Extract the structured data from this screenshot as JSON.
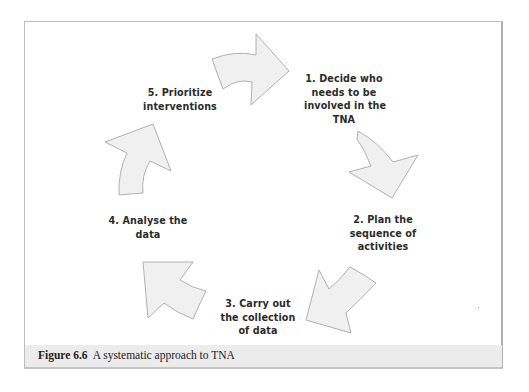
{
  "figure": {
    "number_label": "Figure 6.6",
    "caption_text": "A systematic approach to TNA"
  },
  "diagram": {
    "type": "cycle",
    "steps": [
      {
        "lines": [
          "1. Decide who",
          "needs to be",
          "involved in the",
          "TNA"
        ]
      },
      {
        "lines": [
          "2. Plan the",
          "sequence of",
          "activities"
        ]
      },
      {
        "lines": [
          "3. Carry out",
          "the collection",
          "of data"
        ]
      },
      {
        "lines": [
          "4. Analyse the",
          "data"
        ]
      },
      {
        "lines": [
          "5. Prioritize",
          "interventions"
        ]
      }
    ],
    "arrow_icons": [
      "curved-arrow-right-icon",
      "curved-arrow-down-icon",
      "curved-arrow-down-left-icon",
      "curved-arrow-up-left-icon",
      "curved-arrow-up-icon"
    ],
    "colors": {
      "arrow_fill": "#f0f0f0",
      "arrow_stroke": "#a8a8a8",
      "text": "#2b2b2b",
      "caption_bar": "#ececec",
      "frame_border": "#bdbdbd"
    }
  }
}
